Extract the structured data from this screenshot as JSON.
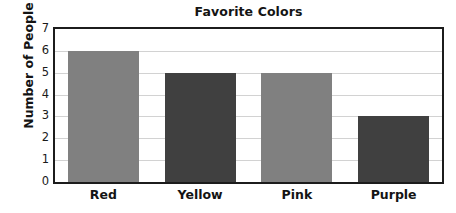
{
  "chart_data": {
    "type": "bar",
    "title": "Favorite Colors",
    "xlabel": "",
    "ylabel": "Number of People",
    "categories": [
      "Red",
      "Yellow",
      "Pink",
      "Purple"
    ],
    "values": [
      6,
      5,
      5,
      3
    ],
    "ylim": [
      0,
      7
    ],
    "y_ticks": [
      0,
      1,
      2,
      3,
      4,
      5,
      6,
      7
    ],
    "y_tick_labels": [
      "0",
      "1",
      "2",
      "3",
      "4",
      "5",
      "6",
      "7"
    ],
    "bar_colors": [
      "#808080",
      "#404040",
      "#808080",
      "#404040"
    ],
    "grid": "horizontal",
    "legend": "none",
    "frame_color": "#1c1c1c",
    "gridline_color": "#d2d2d2",
    "background_color": "#ffffff",
    "text_color": "#141414"
  }
}
